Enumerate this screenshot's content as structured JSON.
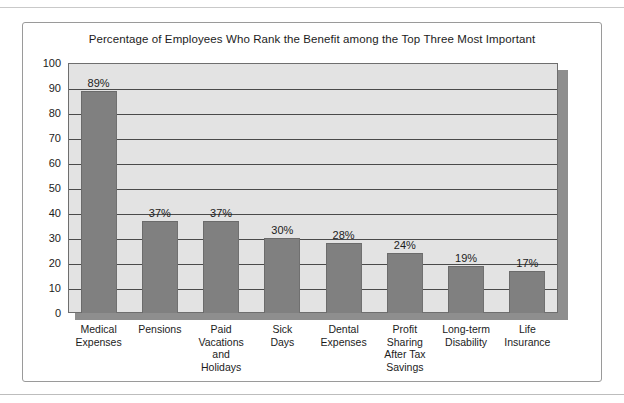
{
  "figure": {
    "title": "Percentage of Employees Who Rank the Benefit among the Top Three Most Important"
  },
  "chart_data": {
    "type": "bar",
    "title": "Percentage of Employees Who Rank the Benefit among the Top Three Most Important",
    "xlabel": "",
    "ylabel": "",
    "ylim": [
      0,
      100
    ],
    "ytick_labels": [
      "100",
      "90",
      "80",
      "70",
      "60",
      "50",
      "40",
      "30",
      "20",
      "10",
      "0"
    ],
    "yticks": [
      100,
      90,
      80,
      70,
      60,
      50,
      40,
      30,
      20,
      10,
      0
    ],
    "grid": true,
    "legend": false,
    "bar_color": "#808080",
    "plot_background": "#e3e3e3",
    "categories": [
      "Medical Expenses",
      "Pensions",
      "Paid Vacations and Holidays",
      "Sick Days",
      "Dental Expenses",
      "Profit Sharing After Tax Savings",
      "Long-term Disability",
      "Life Insurance"
    ],
    "category_lines": [
      [
        "Medical",
        "Expenses"
      ],
      [
        "Pensions"
      ],
      [
        "Paid",
        "Vacations",
        "and",
        "Holidays"
      ],
      [
        "Sick",
        "Days"
      ],
      [
        "Dental",
        "Expenses"
      ],
      [
        "Profit",
        "Sharing",
        "After Tax",
        "Savings"
      ],
      [
        "Long-term",
        "Disability"
      ],
      [
        "Life",
        "Insurance"
      ]
    ],
    "values": [
      89,
      37,
      37,
      30,
      28,
      24,
      19,
      17
    ],
    "value_labels": [
      "89%",
      "37%",
      "37%",
      "30%",
      "28%",
      "24%",
      "19%",
      "17%"
    ]
  }
}
